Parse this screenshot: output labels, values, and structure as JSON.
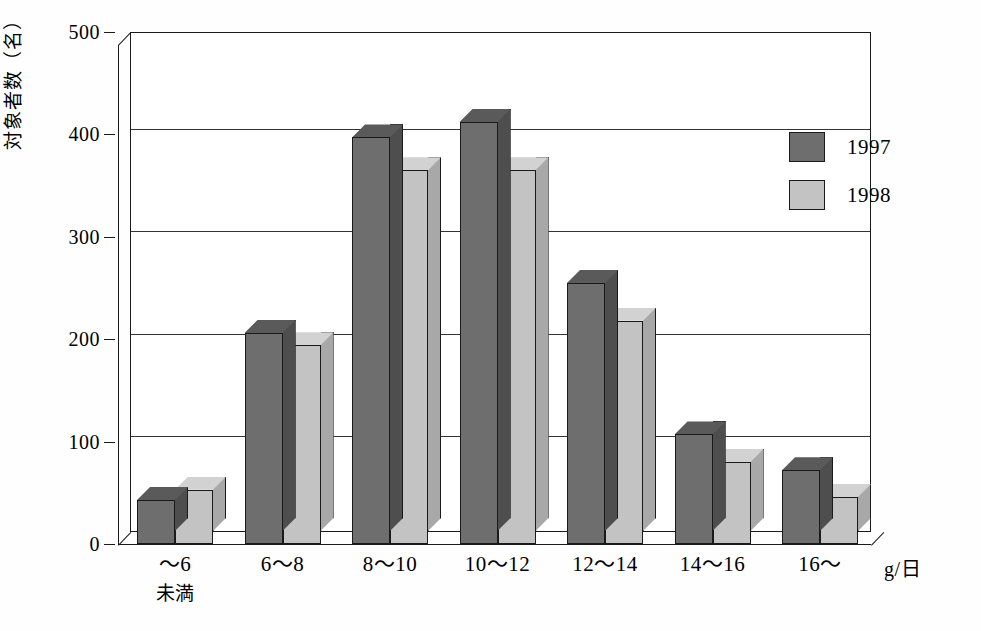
{
  "chart_data": {
    "type": "bar",
    "title": "",
    "xlabel": "g/日",
    "ylabel": "対象者数（名）",
    "categories": [
      "～6",
      "6～8",
      "8～10",
      "10～12",
      "12～14",
      "14～16",
      "16～"
    ],
    "category_sublabels": [
      "未満",
      "",
      "",
      "",
      "",
      "",
      ""
    ],
    "series": [
      {
        "name": "1997",
        "color": "#6e6e6e",
        "values": [
          43,
          206,
          397,
          412,
          255,
          107,
          72
        ]
      },
      {
        "name": "1998",
        "color": "#c3c3c3",
        "values": [
          53,
          194,
          365,
          365,
          218,
          80,
          46
        ]
      }
    ],
    "ylim": [
      0,
      500
    ],
    "yticks": [
      0,
      100,
      200,
      300,
      400,
      500
    ],
    "ytick_labels": [
      "0",
      "100",
      "200",
      "300",
      "400",
      "500"
    ],
    "grid": true,
    "legend_position": "top-right",
    "style": "3d-bars"
  },
  "axis": {
    "unit_label": "g/日",
    "y_title": "対象者数（名）"
  },
  "legend": {
    "entries": [
      {
        "label": "1997",
        "color": "#6e6e6e"
      },
      {
        "label": "1998",
        "color": "#c3c3c3"
      }
    ]
  }
}
